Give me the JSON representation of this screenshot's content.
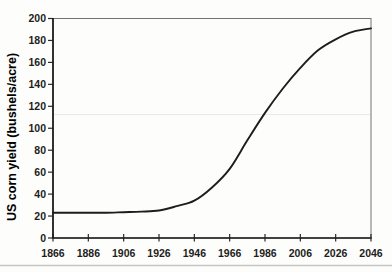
{
  "figure": {
    "colors": {
      "background": "#fdfdfb",
      "text": "#1e1e1c",
      "axis": "#1b1b19",
      "plot_border": "#73736f",
      "tick": "#2b2b29",
      "curve": "#1d1d1b",
      "scan_artifact_line": "#eaeae6",
      "page_rule": "#c5c5c1"
    }
  },
  "chart_data": {
    "type": "line",
    "title": "",
    "xlabel": "",
    "ylabel": "US corn yield (bushels/acre)",
    "xlim": [
      1866,
      2046
    ],
    "ylim": [
      0,
      200
    ],
    "x_ticks": [
      1866,
      1886,
      1906,
      1926,
      1946,
      1966,
      1986,
      2006,
      2026,
      2046
    ],
    "y_ticks": [
      0,
      20,
      40,
      60,
      80,
      100,
      120,
      140,
      160,
      180,
      200
    ],
    "grid": false,
    "legend_position": "none",
    "series": [
      {
        "name": "US corn yield (logistic trend)",
        "color": "#1d1d1b",
        "x": [
          1866,
          1876,
          1886,
          1896,
          1906,
          1916,
          1926,
          1936,
          1946,
          1956,
          1966,
          1976,
          1986,
          1996,
          2006,
          2016,
          2026,
          2036,
          2046
        ],
        "y": [
          23,
          23,
          23,
          23,
          23.5,
          24,
          25,
          29,
          34,
          46,
          63,
          89,
          114,
          136,
          155,
          171,
          181,
          188,
          191
        ]
      }
    ]
  }
}
